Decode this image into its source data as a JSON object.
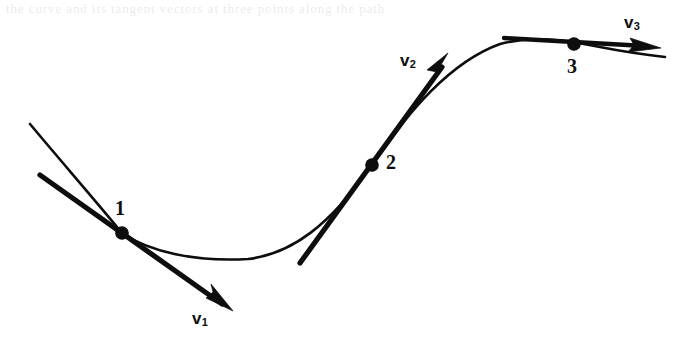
{
  "figure": {
    "background_color": "#ffffff",
    "ink_color": "#0d0d0d",
    "width": 680,
    "height": 348,
    "scan_artifact_text": "the curve and its tangent vectors at three points along the path",
    "points": [
      {
        "label": "1",
        "x": 122,
        "y": 233,
        "label_x": 115,
        "label_y": 198
      },
      {
        "label": "2",
        "x": 372,
        "y": 165,
        "label_x": 386,
        "label_y": 152
      },
      {
        "label": "3",
        "x": 574,
        "y": 44,
        "label_x": 567,
        "label_y": 56
      }
    ],
    "vectors": [
      {
        "name": "v1",
        "label": "v",
        "subscript": "1",
        "label_x": 192,
        "label_y": 310,
        "tail_x": 40,
        "tail_y": 175,
        "tip_x": 231,
        "tip_y": 309,
        "direction": "down-right"
      },
      {
        "name": "v2",
        "label": "v",
        "subscript": "2",
        "label_x": 400,
        "label_y": 52,
        "tail_x": 300,
        "tail_y": 263,
        "tip_x": 448,
        "tip_y": 54,
        "direction": "up-right"
      },
      {
        "name": "v3",
        "label": "v",
        "subscript": "3",
        "label_x": 624,
        "label_y": 14,
        "tail_x": 504,
        "tail_y": 38,
        "tip_x": 660,
        "tip_y": 48,
        "direction": "right"
      }
    ],
    "curve": {
      "start_x": 30,
      "start_y": 124,
      "end_x": 665,
      "end_y": 57,
      "minimum_x": 248,
      "minimum_y": 259,
      "maximum_x": 560,
      "maximum_y": 42
    }
  }
}
